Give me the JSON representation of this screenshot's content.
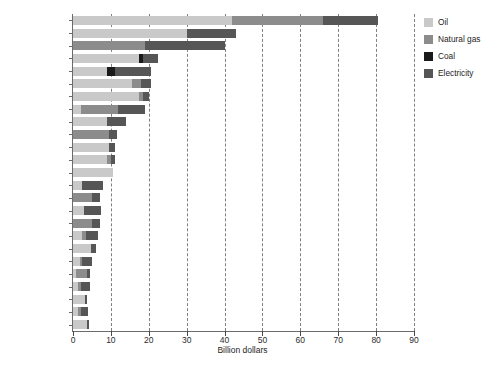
{
  "chart_data": {
    "type": "bar",
    "orientation": "horizontal",
    "stacked": true,
    "title": "",
    "xlabel": "Billion dollars",
    "ylabel": "",
    "xlim": [
      0,
      90
    ],
    "xticks": [
      0,
      10,
      20,
      30,
      40,
      50,
      60,
      70,
      80,
      90
    ],
    "grid": "vertical-dashed",
    "legend_position": "right",
    "categories": [
      "Iran",
      "Saudi Arabia",
      "Russia",
      "India",
      "China",
      "Egypt",
      "Venezuela",
      "UAE",
      "Indonesia",
      "Uzbekistan",
      "Iraq",
      "Algeria",
      "Mexico",
      "Thailand",
      "Ukraine",
      "Kuwait",
      "Pakistan",
      "Argentina",
      "Malaysia",
      "Bangladesh",
      "Turkmenistan",
      "Kazakhstan",
      "Libya",
      "Qatar",
      "Ecuador"
    ],
    "series": [
      {
        "name": "Oil",
        "color": "#c9c9c9",
        "values": [
          42.0,
          30.0,
          0.0,
          17.5,
          9.0,
          15.5,
          17.5,
          2.0,
          9.0,
          0.0,
          9.5,
          9.0,
          10.5,
          2.5,
          0.0,
          3.0,
          0.0,
          2.5,
          4.7,
          1.8,
          0.8,
          1.3,
          3.2,
          1.2,
          3.6
        ]
      },
      {
        "name": "Natural gas",
        "color": "#8c8c8c",
        "values": [
          24.0,
          0.0,
          19.0,
          0.0,
          0.0,
          2.5,
          1.0,
          10.0,
          0.0,
          9.5,
          0.0,
          1.0,
          0.0,
          0.0,
          5.0,
          0.0,
          5.0,
          1.0,
          0.0,
          0.6,
          3.0,
          0.8,
          0.0,
          1.0,
          0.0
        ]
      },
      {
        "name": "Coal",
        "color": "#1a1a1a",
        "values": [
          0.0,
          0.0,
          0.0,
          1.0,
          2.0,
          0.0,
          0.0,
          0.0,
          0.0,
          0.0,
          0.0,
          0.0,
          0.0,
          0.0,
          0.0,
          0.0,
          0.0,
          0.0,
          0.0,
          0.0,
          0.0,
          0.0,
          0.0,
          0.0,
          0.0
        ]
      },
      {
        "name": "Electricity",
        "color": "#565656",
        "values": [
          14.5,
          13.0,
          21.0,
          4.0,
          9.5,
          2.5,
          1.5,
          7.0,
          5.0,
          2.0,
          1.5,
          1.0,
          0.0,
          5.5,
          2.0,
          4.5,
          2.0,
          3.0,
          1.3,
          2.6,
          0.7,
          2.4,
          0.4,
          1.8,
          0.5
        ]
      }
    ],
    "totals": [
      80.5,
      43.0,
      40.0,
      22.5,
      20.5,
      20.5,
      20.0,
      19.0,
      14.0,
      11.5,
      11.0,
      11.0,
      10.5,
      8.0,
      7.0,
      7.5,
      7.0,
      6.5,
      6.0,
      5.0,
      4.5,
      4.5,
      3.6,
      4.0,
      4.1
    ]
  },
  "legend": {
    "items": [
      {
        "label": "Oil",
        "color": "#c9c9c9"
      },
      {
        "label": "Natural gas",
        "color": "#8c8c8c"
      },
      {
        "label": "Coal",
        "color": "#1a1a1a"
      },
      {
        "label": "Electricity",
        "color": "#565656"
      }
    ]
  },
  "axis": {
    "x_title": "Billion dollars",
    "x_tick_labels": [
      "0",
      "10",
      "20",
      "30",
      "40",
      "50",
      "60",
      "70",
      "80",
      "90"
    ]
  }
}
